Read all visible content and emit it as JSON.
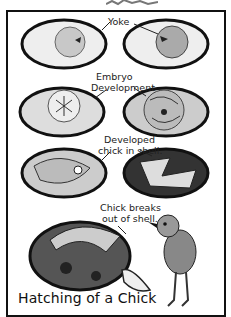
{
  "title": "Hatching of a Chick",
  "labels": {
    "yoke": "Yoke",
    "embryo_line1": "Embryo",
    "embryo_line2": "Development",
    "developed_line1": "Developed",
    "developed_line2": "chick in shell.",
    "breaks_line1": "Chick breaks",
    "breaks_line2": "out of shell."
  },
  "stages": [
    {
      "name": "Yoke",
      "eggs": 2
    },
    {
      "name": "Embryo Development",
      "eggs": 2
    },
    {
      "name": "Developed chick in shell.",
      "eggs": 2
    },
    {
      "name": "Chick breaks out of shell.",
      "eggs": 1
    }
  ],
  "colors": {
    "ink": "#111111",
    "shade": "#555555",
    "yolk": "#bdbdbd",
    "paper": "#ffffff"
  }
}
